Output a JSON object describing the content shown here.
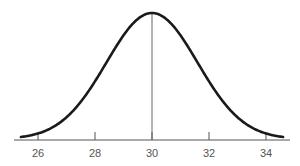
{
  "chart_data": {
    "type": "line",
    "title": "",
    "xlabel": "",
    "ylabel": "",
    "mean": 30,
    "sd": 1.6,
    "xlim": [
      25.2,
      34.8
    ],
    "x_ticks": [
      26,
      28,
      30,
      32,
      34
    ],
    "x_tick_labels": [
      "26",
      "28",
      "30",
      "32",
      "34"
    ],
    "annotations": [
      {
        "type": "vertical_line",
        "x": 30,
        "label": ""
      }
    ],
    "grid": false,
    "legend": null,
    "colors": {
      "curve": "#1a1a1a",
      "axis": "#555555",
      "mean_line": "#666666"
    }
  }
}
